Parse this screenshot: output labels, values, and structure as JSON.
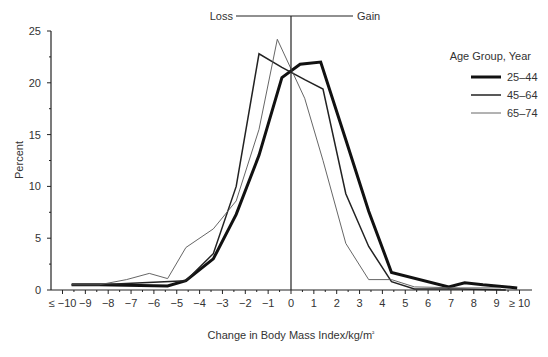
{
  "chart_data": {
    "type": "line",
    "title": "",
    "xlabel": "Change in Body Mass Index/kg/m²",
    "ylabel": "Percent",
    "ylim": [
      0,
      25
    ],
    "yticks": [
      "0",
      "5",
      "10",
      "15",
      "20",
      "25"
    ],
    "categories": [
      "≤ −10",
      "−9",
      "−8",
      "−7",
      "−6",
      "−5",
      "−4",
      "−3",
      "−2",
      "−1",
      "0",
      "1",
      "2",
      "3",
      "4",
      "5",
      "6",
      "7",
      "8",
      "9",
      "≥ 10"
    ],
    "annotations": {
      "loss": "Loss",
      "gain": "Gain"
    },
    "legend": {
      "title": "Age Group, Year",
      "position": "right"
    },
    "grid": false,
    "series": [
      {
        "name": "25–44",
        "style": "thick",
        "x": [
          -9.6,
          -8.4,
          -5.4,
          -4.6,
          -3.4,
          -2.4,
          -1.4,
          -0.4,
          0.4,
          1.3,
          2.4,
          3.4,
          4.4,
          6.9,
          7.6,
          8.4,
          9.9
        ],
        "values": [
          0.5,
          0.5,
          0.4,
          0.9,
          3.0,
          7.3,
          13.0,
          20.5,
          21.8,
          22.0,
          14.5,
          7.6,
          1.7,
          0.3,
          0.7,
          0.5,
          0.2
        ]
      },
      {
        "name": "45–64",
        "style": "medium",
        "x": [
          -9.6,
          -8.4,
          -4.6,
          -3.4,
          -2.4,
          -1.4,
          -0.4,
          0.6,
          1.4,
          2.4,
          3.4,
          4.4,
          5.4,
          7.4,
          9.4
        ],
        "values": [
          0.5,
          0.5,
          0.9,
          3.5,
          10.0,
          22.8,
          21.5,
          20.3,
          19.4,
          9.3,
          4.2,
          0.8,
          0.1,
          0.1,
          0.0
        ]
      },
      {
        "name": "65–74",
        "style": "thin",
        "x": [
          -9.6,
          -8.4,
          -7.2,
          -6.2,
          -5.4,
          -4.6,
          -3.4,
          -2.4,
          -1.4,
          -0.6,
          0.6,
          1.4,
          2.4,
          3.4,
          4.4,
          5.4,
          7.4,
          9.2
        ],
        "values": [
          0.5,
          0.5,
          1.0,
          1.6,
          1.1,
          4.1,
          5.9,
          8.6,
          15.5,
          24.2,
          18.5,
          12.5,
          4.5,
          1.0,
          1.0,
          0.3,
          0.2,
          0.2
        ]
      }
    ]
  }
}
